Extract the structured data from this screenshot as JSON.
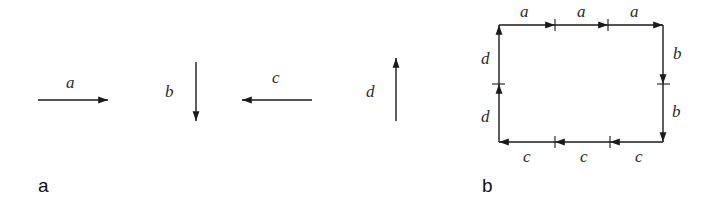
{
  "panels": {
    "a": {
      "label": "a",
      "vectors": [
        {
          "name": "a",
          "direction": "right"
        },
        {
          "name": "b",
          "direction": "down"
        },
        {
          "name": "c",
          "direction": "left"
        },
        {
          "name": "d",
          "direction": "up"
        }
      ]
    },
    "b": {
      "label": "b",
      "top": [
        "a",
        "a",
        "a"
      ],
      "right": [
        "b",
        "b"
      ],
      "bottom": [
        "c",
        "c",
        "c"
      ],
      "left": [
        "d",
        "d"
      ]
    }
  },
  "colors": {
    "stroke": "#1a1a1a",
    "text": "#2a2a2a"
  }
}
